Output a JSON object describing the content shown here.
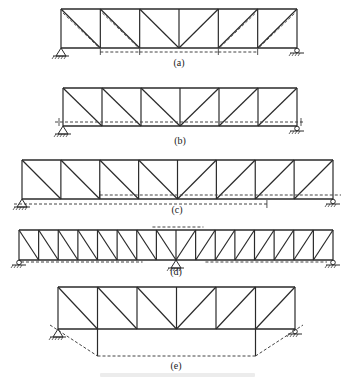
{
  "figure": {
    "stroke_color": "#2a2a2a",
    "dash_color": "#444444",
    "diagrams": [
      {
        "id": "a",
        "label": "(a)",
        "x0": 61,
        "x1": 297,
        "top": 9,
        "bottom": 48,
        "panels": 6,
        "pattern": "pratt-a",
        "label_y": 57,
        "supports": [
          {
            "type": "pin",
            "x": 61
          },
          {
            "type": "roller",
            "x": 297
          }
        ]
      },
      {
        "id": "b",
        "label": "(b)",
        "x0": 63,
        "x1": 297,
        "top": 88,
        "bottom": 126,
        "panels": 6,
        "pattern": "pratt-b",
        "label_y": 135,
        "supports": [
          {
            "type": "pin",
            "x": 63
          },
          {
            "type": "roller",
            "x": 297
          }
        ]
      },
      {
        "id": "c",
        "label": "(c)",
        "x0": 22,
        "x1": 333,
        "top": 160,
        "bottom": 199,
        "panels": 8,
        "pattern": "pratt",
        "label_y": 204,
        "supports": [
          {
            "type": "pin",
            "x": 22
          },
          {
            "type": "roller",
            "x": 333
          }
        ]
      },
      {
        "id": "d",
        "label": "(d)",
        "x0": 19,
        "x1": 333,
        "top": 230,
        "bottom": 260,
        "panels": 16,
        "pattern": "pratt",
        "label_y": 266,
        "supports": [
          {
            "type": "roller",
            "x": 19
          },
          {
            "type": "pin",
            "x": 176
          },
          {
            "type": "roller",
            "x": 333
          }
        ]
      },
      {
        "id": "e",
        "label": "(e)",
        "x0": 58,
        "x1": 295,
        "top": 287,
        "bottom": 329,
        "panels": 6,
        "pattern": "pratt-e",
        "label_y": 360,
        "supports": [
          {
            "type": "pin",
            "x": 58
          },
          {
            "type": "roller",
            "x": 295
          }
        ]
      }
    ],
    "caption": ""
  }
}
